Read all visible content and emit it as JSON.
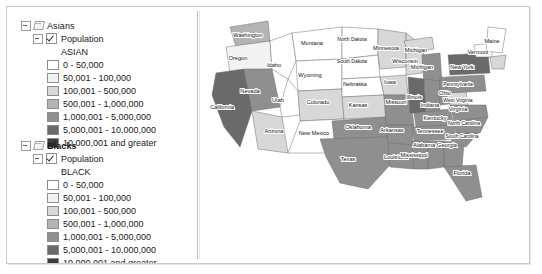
{
  "window": {
    "title": "Map Viewer"
  },
  "toc": {
    "groups": [
      {
        "name": "Asians",
        "bold": false,
        "expander_icon": "minus-box-icon",
        "layer_icon": "layer-glyph-icon",
        "sub": {
          "label": "Population",
          "checked": true,
          "checkbox_icon": "checked-checkbox-icon",
          "expander_icon": "minus-box-icon"
        },
        "field": "ASIAN",
        "classes": [
          {
            "label": "0 - 50,000",
            "color": "#ffffff"
          },
          {
            "label": "50,001 - 100,000",
            "color": "#f2f2f2"
          },
          {
            "label": "100,001 - 500,000",
            "color": "#d8d8d8"
          },
          {
            "label": "500,001 - 1,000,000",
            "color": "#b4b4b4"
          },
          {
            "label": "1,000,001 - 5,000,000",
            "color": "#8f8f8f"
          },
          {
            "label": "5,000,001 - 10,000,000",
            "color": "#6a6a6a"
          },
          {
            "label": "10,000,001 and greater",
            "color": "#3c3c3c"
          }
        ]
      },
      {
        "name": "Blacks",
        "bold": true,
        "expander_icon": "minus-box-icon",
        "layer_icon": "layer-glyph-icon",
        "sub": {
          "label": "Population",
          "checked": true,
          "checkbox_icon": "checked-checkbox-icon",
          "expander_icon": "minus-box-icon"
        },
        "field": "BLACK",
        "classes": [
          {
            "label": "0 - 50,000",
            "color": "#ffffff"
          },
          {
            "label": "50,001 - 100,000",
            "color": "#f2f2f2"
          },
          {
            "label": "100,001 - 500,000",
            "color": "#d8d8d8"
          },
          {
            "label": "500,001 - 1,000,000",
            "color": "#b4b4b4"
          },
          {
            "label": "1,000,001 - 5,000,000",
            "color": "#8f8f8f"
          },
          {
            "label": "5,000,001 - 10,000,000",
            "color": "#6a6a6a"
          },
          {
            "label": "10,000,001 and greater",
            "color": "#3c3c3c"
          }
        ]
      }
    ]
  },
  "map": {
    "title": "United States choropleth",
    "states": [
      {
        "name": "Washington",
        "x": 48,
        "y": 30,
        "fill": "#b4b4b4"
      },
      {
        "name": "Oregon",
        "x": 38,
        "y": 53,
        "fill": "#f2f2f2"
      },
      {
        "name": "California",
        "x": 22,
        "y": 102,
        "fill": "#6a6a6a"
      },
      {
        "name": "Nevada",
        "x": 50,
        "y": 86,
        "fill": "#8f8f8f"
      },
      {
        "name": "Idaho",
        "x": 74,
        "y": 60,
        "fill": "#ffffff"
      },
      {
        "name": "Montana",
        "x": 112,
        "y": 38,
        "fill": "#ffffff"
      },
      {
        "name": "Wyoming",
        "x": 110,
        "y": 70,
        "fill": "#ffffff"
      },
      {
        "name": "Utah",
        "x": 78,
        "y": 95,
        "fill": "#ffffff"
      },
      {
        "name": "Colorado",
        "x": 118,
        "y": 97,
        "fill": "#d8d8d8"
      },
      {
        "name": "Arizona",
        "x": 74,
        "y": 126,
        "fill": "#d8d8d8"
      },
      {
        "name": "New Mexico",
        "x": 114,
        "y": 128,
        "fill": "#ffffff"
      },
      {
        "name": "North Dakota",
        "x": 152,
        "y": 34,
        "fill": "#ffffff"
      },
      {
        "name": "South Dakota",
        "x": 152,
        "y": 56,
        "fill": "#ffffff"
      },
      {
        "name": "Nebraska",
        "x": 155,
        "y": 79,
        "fill": "#ffffff"
      },
      {
        "name": "Kansas",
        "x": 158,
        "y": 100,
        "fill": "#d8d8d8"
      },
      {
        "name": "Oklahoma",
        "x": 158,
        "y": 122,
        "fill": "#8f8f8f"
      },
      {
        "name": "Texas",
        "x": 148,
        "y": 154,
        "fill": "#8f8f8f"
      },
      {
        "name": "Minnesota",
        "x": 186,
        "y": 43,
        "fill": "#d8d8d8"
      },
      {
        "name": "Iowa",
        "x": 190,
        "y": 77,
        "fill": "#d8d8d8"
      },
      {
        "name": "Missouri",
        "x": 196,
        "y": 97,
        "fill": "#8f8f8f"
      },
      {
        "name": "Arkansas",
        "x": 192,
        "y": 125,
        "fill": "#8f8f8f"
      },
      {
        "name": "Louisiana",
        "x": 196,
        "y": 152,
        "fill": "#8f8f8f"
      },
      {
        "name": "Wisconsin",
        "x": 205,
        "y": 56,
        "fill": "#d8d8d8"
      },
      {
        "name": "Michigan",
        "x": 216,
        "y": 45,
        "fill": "#d8d8d8"
      },
      {
        "name": "Michigan",
        "x": 222,
        "y": 62,
        "fill": "#8f8f8f"
      },
      {
        "name": "Illinois",
        "x": 214,
        "y": 92,
        "fill": "#6a6a6a"
      },
      {
        "name": "Indiana",
        "x": 230,
        "y": 100,
        "fill": "#8f8f8f"
      },
      {
        "name": "Ohio",
        "x": 245,
        "y": 88,
        "fill": "#8f8f8f"
      },
      {
        "name": "Kentucky",
        "x": 235,
        "y": 113,
        "fill": "#8f8f8f"
      },
      {
        "name": "Tennessee",
        "x": 230,
        "y": 126,
        "fill": "#8f8f8f"
      },
      {
        "name": "Mississippi",
        "x": 214,
        "y": 150,
        "fill": "#8f8f8f"
      },
      {
        "name": "Alabama",
        "x": 224,
        "y": 140,
        "fill": "#8f8f8f"
      },
      {
        "name": "Georgia",
        "x": 247,
        "y": 140,
        "fill": "#8f8f8f"
      },
      {
        "name": "Florida",
        "x": 262,
        "y": 168,
        "fill": "#8f8f8f"
      },
      {
        "name": "South Carolina",
        "x": 262,
        "y": 131,
        "fill": "#8f8f8f"
      },
      {
        "name": "North Carolina",
        "x": 264,
        "y": 118,
        "fill": "#8f8f8f"
      },
      {
        "name": "Virginia",
        "x": 258,
        "y": 104,
        "fill": "#8f8f8f"
      },
      {
        "name": "West Virginia",
        "x": 258,
        "y": 95,
        "fill": "#d8d8d8"
      },
      {
        "name": "Pennsylvania",
        "x": 258,
        "y": 79,
        "fill": "#8f8f8f"
      },
      {
        "name": "New York",
        "x": 262,
        "y": 62,
        "fill": "#6a6a6a"
      },
      {
        "name": "Vermont",
        "x": 278,
        "y": 47,
        "fill": "#ffffff"
      },
      {
        "name": "Maine",
        "x": 292,
        "y": 36,
        "fill": "#ffffff"
      }
    ]
  }
}
